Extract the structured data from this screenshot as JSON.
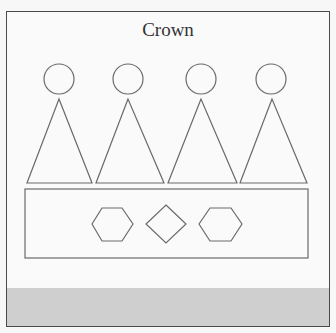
{
  "diagram": {
    "title": "Crown",
    "colors": {
      "stroke": "#6a6a6a",
      "frame_border": "#4a4a4a",
      "background": "#fafafa",
      "footer_band": "#cfcfcf"
    },
    "elements": {
      "circles": [
        {
          "cx": 59,
          "cy": 79,
          "r": 15
        },
        {
          "cx": 128,
          "cy": 79,
          "r": 15
        },
        {
          "cx": 201,
          "cy": 79,
          "r": 15
        },
        {
          "cx": 271,
          "cy": 79,
          "r": 15
        }
      ],
      "triangles": [
        {
          "apex": [
            59,
            99
          ],
          "base_left": [
            27,
            183
          ],
          "base_right": [
            92,
            183
          ]
        },
        {
          "apex": [
            128,
            99
          ],
          "base_left": [
            96,
            183
          ],
          "base_right": [
            164,
            183
          ]
        },
        {
          "apex": [
            201,
            99
          ],
          "base_left": [
            168,
            183
          ],
          "base_right": [
            237,
            183
          ]
        },
        {
          "apex": [
            272,
            99
          ],
          "base_left": [
            240,
            183
          ],
          "base_right": [
            307,
            183
          ]
        }
      ],
      "band_rectangle": {
        "x": 25,
        "y": 189,
        "width": 283,
        "height": 69
      },
      "gems": [
        {
          "shape": "hexagon",
          "cx": 112,
          "cy": 224
        },
        {
          "shape": "diamond",
          "cx": 166,
          "cy": 224
        },
        {
          "shape": "hexagon",
          "cx": 220,
          "cy": 224
        }
      ]
    }
  }
}
